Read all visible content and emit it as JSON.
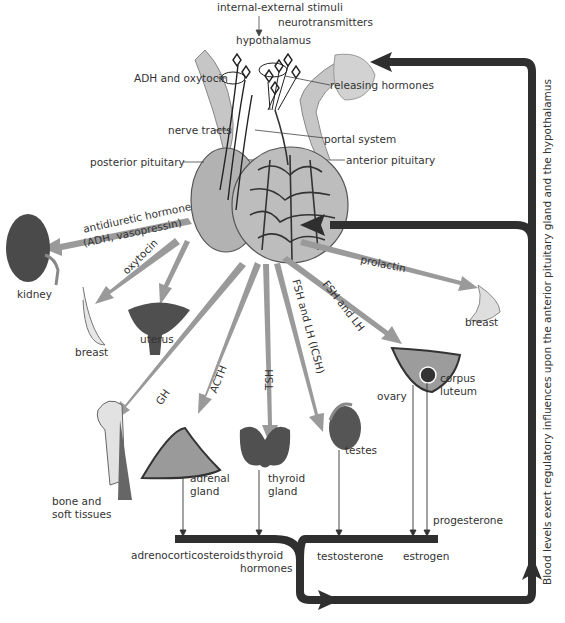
{
  "diagram": {
    "top": {
      "stimuli": "internal-external stimuli",
      "neurotransmitters": "neurotransmitters",
      "hypothalamus": "hypothalamus"
    },
    "pituitary_labels": {
      "adh_oxytocin": "ADH and oxytocin",
      "releasing_hormones": "releasing hormones",
      "nerve_tracts": "nerve tracts",
      "portal_system": "portal system",
      "posterior_pituitary": "posterior pituitary",
      "anterior_pituitary": "anterior pituitary"
    },
    "hormones": {
      "adh_line1": "antidiuretic hormone",
      "adh_line2": "(ADH, vasopressin)",
      "oxytocin": "oxytocin",
      "prolactin": "prolactin",
      "gh": "GH",
      "acth": "ACTH",
      "tsh": "TSH",
      "fsh_lh_icsh": "FSH and LH (ICSH)",
      "fsh_lh": "FSH and LH"
    },
    "targets": {
      "kidney": "kidney",
      "breast_left": "breast",
      "uterus": "uterus",
      "breast_right": "breast",
      "bone_line1": "bone and",
      "bone_line2": "soft tissues",
      "adrenal_line1": "adrenal",
      "adrenal_line2": "gland",
      "thyroid_line1": "thyroid",
      "thyroid_line2": "gland",
      "testes": "testes",
      "ovary": "ovary",
      "corpus_line1": "corpus",
      "corpus_line2": "luteum"
    },
    "products": {
      "adrenocorticosteroids": "adrenocorticosteroids",
      "thyroid_line1": "thyroid",
      "thyroid_line2": "hormones",
      "testosterone": "testosterone",
      "estrogen": "estrogen",
      "progesterone": "progesterone"
    },
    "feedback_label": "Blood levels exert regulatory influences upon the anterior pituitary gland and the hypothalamus",
    "colors": {
      "feedback_arrow": "#2f2f2f",
      "hormone_arrow": "#9a9a9a",
      "gland": "#b9b9b9",
      "organ_dark": "#4a4a4a"
    }
  }
}
